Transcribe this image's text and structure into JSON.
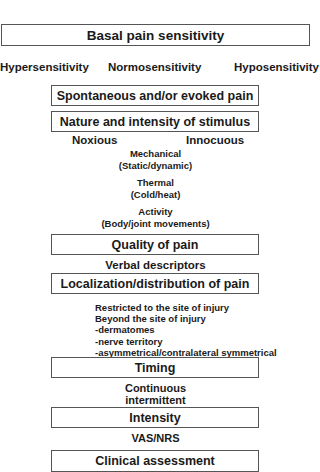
{
  "diagram": {
    "sections": {
      "basal": {
        "title": "Basal pain sensitivity",
        "options": [
          "Hypersensitivity",
          "Normosensitivity",
          "Hyposensitivity"
        ]
      },
      "spontaneous": {
        "title": "Spontaneous and/or evoked pain"
      },
      "nature": {
        "title": "Nature and intensity of stimulus",
        "poles": [
          "Noxious",
          "Innocuous"
        ],
        "types": [
          {
            "name": "Mechanical",
            "detail": "(Static/dynamic)"
          },
          {
            "name": "Thermal",
            "detail": "(Cold/heat)"
          },
          {
            "name": "Activity",
            "detail": "(Body/joint movements)"
          }
        ]
      },
      "quality": {
        "title": "Quality of pain",
        "detail": "Verbal descriptors"
      },
      "localization": {
        "title": "Localization/distribution of pain",
        "items": [
          "Restricted to the site of injury",
          "Beyond the site of injury",
          "-dermatomes",
          "-nerve territory",
          "-asymmetrical/contralateral symmetrical"
        ]
      },
      "timing": {
        "title": "Timing",
        "details": [
          "Continuous",
          "intermittent"
        ]
      },
      "intensity": {
        "title": "Intensity",
        "detail": "VAS/NRS"
      },
      "clinical": {
        "title": "Clinical assessment"
      }
    }
  }
}
